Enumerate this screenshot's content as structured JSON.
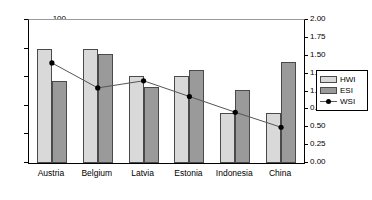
{
  "chart_data": {
    "type": "bar",
    "title": "",
    "xlabel": "",
    "ylabel": "",
    "categories": [
      "Austria",
      "Belgium",
      "Latvia",
      "Estonia",
      "Indonesia",
      "China"
    ],
    "series": [
      {
        "name": "HWI",
        "axis": "left",
        "type": "bar",
        "color": "#d9d9d9",
        "values": [
          80,
          79.5,
          61,
          61,
          35,
          35
        ]
      },
      {
        "name": "ESI",
        "axis": "left",
        "type": "bar",
        "color": "#9a9a9a",
        "values": [
          57.5,
          76,
          53,
          65,
          51,
          70.5
        ]
      },
      {
        "name": "WSI",
        "axis": "right",
        "type": "line",
        "color": "#000000",
        "values": [
          1.4,
          1.05,
          1.15,
          0.93,
          0.71,
          0.5
        ]
      }
    ],
    "left_axis": {
      "ylim": [
        0,
        100
      ],
      "ticks": [
        0,
        20,
        40,
        60,
        80,
        100
      ],
      "tick_labels": [
        "0",
        "20",
        "40",
        "60",
        "80",
        "100"
      ]
    },
    "right_axis": {
      "ylim": [
        0,
        2.0
      ],
      "ticks": [
        0,
        0.25,
        0.5,
        0.75,
        1.0,
        1.25,
        1.5,
        1.75,
        2.0
      ],
      "tick_labels": [
        "0.00",
        "0.25",
        "0.50",
        "0.75",
        "1.00",
        "1.25",
        "1.50",
        "1.75",
        "2.00"
      ]
    },
    "grid": false,
    "legend": {
      "position": "right",
      "entries": [
        {
          "label": "HWI",
          "marker": "filled-square-light"
        },
        {
          "label": "ESI",
          "marker": "filled-square-dark"
        },
        {
          "label": "WSI",
          "marker": "line-with-dot"
        }
      ]
    }
  }
}
